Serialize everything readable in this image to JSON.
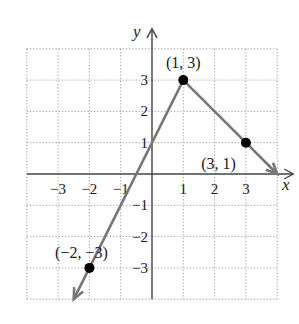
{
  "chart_data": {
    "type": "line",
    "title": "",
    "xlabel": "x",
    "ylabel": "y",
    "xlim": [
      -4,
      4
    ],
    "ylim": [
      -4,
      4
    ],
    "grid": true,
    "x_ticks": [
      -3,
      -2,
      -1,
      1,
      2,
      3
    ],
    "y_ticks": [
      -3,
      -2,
      -1,
      1,
      2,
      3
    ],
    "x_tick_labels": [
      "−3",
      "−2",
      "−1",
      "1",
      "2",
      "3"
    ],
    "y_tick_labels": [
      "−3",
      "−2",
      "−1",
      "1",
      "2",
      "3"
    ],
    "series": [
      {
        "name": "piecewise",
        "x": [
          -2.5,
          -2,
          1,
          3,
          4
        ],
        "y": [
          -4,
          -3,
          3,
          1,
          0
        ],
        "arrows": "both-ends"
      }
    ],
    "points": [
      {
        "x": 1,
        "y": 3,
        "label": "(1, 3)"
      },
      {
        "x": 3,
        "y": 1,
        "label": "(3, 1)"
      },
      {
        "x": -2,
        "y": -3,
        "label": "(−2, −3)"
      }
    ],
    "colors": {
      "line": "#777777",
      "grid": "#999999",
      "axis": "#444444",
      "point": "#000000"
    }
  }
}
